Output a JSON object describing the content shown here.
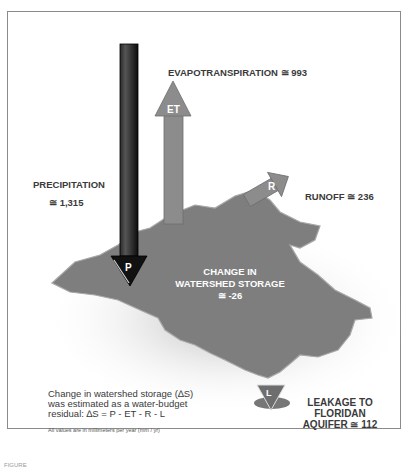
{
  "diagram": {
    "flows": {
      "precipitation": {
        "label": "PRECIPITATION",
        "value": "≅ 1,315",
        "arrow_letter": "P"
      },
      "evapotranspiration": {
        "label": "EVAPOTRANSPIRATION ≅ 993",
        "arrow_letter": "ET"
      },
      "runoff": {
        "label": "RUNOFF ≅ 236",
        "arrow_letter": "R"
      },
      "storage": {
        "line1": "CHANGE IN",
        "line2": "WATERSHED STORAGE",
        "value": "≅ -26"
      },
      "leakage": {
        "line1": "LEAKAGE TO",
        "line2": "FLORIDAN",
        "line3": "AQUIFER ≅ 112",
        "arrow_letter": "L"
      }
    },
    "note": {
      "line1": "Change in watershed storage (∆S)",
      "line2": "was estimated as a water-budget",
      "line3": "residual: ∆S = P - ET - R - L",
      "units": "All values are in millimeters per year (mm / yr)"
    },
    "figure_label": "FIGURE"
  }
}
